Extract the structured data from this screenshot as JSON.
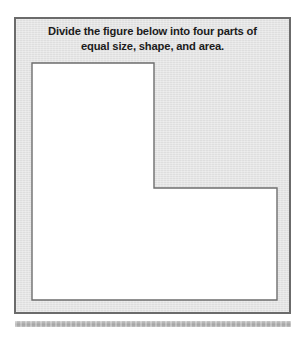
{
  "page": {
    "background_color": "#ffffff",
    "width": 306,
    "height": 339
  },
  "panel": {
    "background_color": "#e4e4e4",
    "border_color": "#6b6b6b"
  },
  "prompt": {
    "line1": "Divide the figure below into four parts of",
    "line2": "equal size, shape, and area.",
    "full_text": "Divide the figure below into four parts of equal size, shape, and area.",
    "text_color": "#1b1b1b"
  },
  "figure": {
    "name": "l-shaped-polygon",
    "fill_color": "#ffffff",
    "stroke_color": "#6e6e6e",
    "stroke_width": 1.4,
    "points_svg": "16,44 138,44 138,169 261,169 261,281 16,281",
    "vertices": [
      {
        "label": "top-left",
        "x": 16,
        "y": 44
      },
      {
        "label": "top-right-of-upper-arm",
        "x": 138,
        "y": 44
      },
      {
        "label": "inner-notch-corner",
        "x": 138,
        "y": 169
      },
      {
        "label": "right-edge-top",
        "x": 261,
        "y": 169
      },
      {
        "label": "bottom-right",
        "x": 261,
        "y": 281
      },
      {
        "label": "bottom-left",
        "x": 16,
        "y": 281
      }
    ]
  },
  "bottom_bar": {
    "name": "separator-bar",
    "color": "#b5b5b5"
  }
}
